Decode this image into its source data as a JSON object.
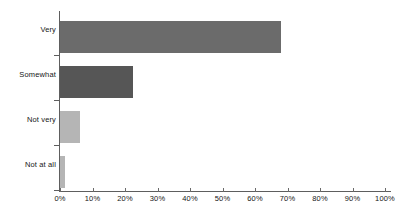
{
  "chart_data": {
    "type": "bar",
    "orientation": "horizontal",
    "title": "",
    "subtitle": "",
    "xlabel": "",
    "ylabel": "",
    "categories": [
      "Very",
      "Somewhat",
      "Not very",
      "Not at all"
    ],
    "values": [
      68,
      22.5,
      6,
      1.5
    ],
    "value_labels": [
      "68%",
      "22.5%",
      "6%",
      "1.5%"
    ],
    "series": [
      {
        "name": "Share of respondents",
        "values": [
          68,
          22.5,
          6,
          1.5
        ]
      }
    ],
    "bar_colors": [
      "#6b6b6b",
      "#565656",
      "#b5b5b5",
      "#b5b5b5"
    ],
    "xlim": [
      0,
      100
    ],
    "xticks": [
      0,
      10,
      20,
      30,
      40,
      50,
      60,
      70,
      80,
      90,
      100
    ],
    "xtick_labels": [
      "0%",
      "10%",
      "20%",
      "30%",
      "40%",
      "50%",
      "60%",
      "70%",
      "80%",
      "90%",
      "100%"
    ],
    "grid": false,
    "legend": false,
    "legend_position": "none",
    "axis_color": "#5e5e5e",
    "background_color": "#ffffff",
    "text_color": "#161616"
  }
}
